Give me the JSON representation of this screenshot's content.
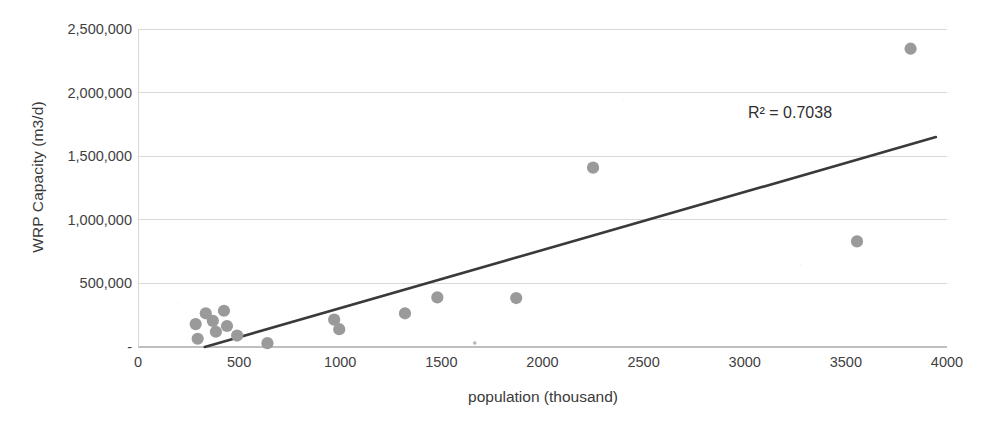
{
  "chart_data": {
    "type": "scatter",
    "title": "",
    "xlabel": "population (thousand)",
    "ylabel": "WRP Capacity (m3/d)",
    "xlim": [
      0,
      4000
    ],
    "ylim": [
      0,
      2500000
    ],
    "grid": true,
    "legend": "none",
    "x_ticks": [
      {
        "value": 0,
        "label": "0"
      },
      {
        "value": 500,
        "label": "500"
      },
      {
        "value": 1000,
        "label": "1000"
      },
      {
        "value": 1500,
        "label": "1500"
      },
      {
        "value": 2000,
        "label": "2000"
      },
      {
        "value": 2500,
        "label": "2500"
      },
      {
        "value": 3000,
        "label": "3000"
      },
      {
        "value": 3500,
        "label": "3500"
      },
      {
        "value": 4000,
        "label": "4000"
      }
    ],
    "y_ticks": [
      {
        "value": 0,
        "label": "-"
      },
      {
        "value": 500000,
        "label": "500,000"
      },
      {
        "value": 1000000,
        "label": "1,000,000"
      },
      {
        "value": 1500000,
        "label": "1,500,000"
      },
      {
        "value": 2000000,
        "label": "2,000,000"
      },
      {
        "value": 2500000,
        "label": "2,500,000"
      }
    ],
    "points": [
      {
        "x": 285,
        "y": 180000
      },
      {
        "x": 295,
        "y": 65000
      },
      {
        "x": 335,
        "y": 265000
      },
      {
        "x": 370,
        "y": 205000
      },
      {
        "x": 385,
        "y": 120000
      },
      {
        "x": 425,
        "y": 285000
      },
      {
        "x": 440,
        "y": 165000
      },
      {
        "x": 490,
        "y": 90000
      },
      {
        "x": 640,
        "y": 30000
      },
      {
        "x": 970,
        "y": 215000
      },
      {
        "x": 995,
        "y": 140000
      },
      {
        "x": 1320,
        "y": 265000
      },
      {
        "x": 1480,
        "y": 390000
      },
      {
        "x": 1665,
        "y": 32000
      },
      {
        "x": 1870,
        "y": 385000
      },
      {
        "x": 2250,
        "y": 1410000
      },
      {
        "x": 3555,
        "y": 830000
      },
      {
        "x": 3820,
        "y": 2345000
      }
    ],
    "trendline": {
      "label": "linear trendline",
      "x_start": 330,
      "y_start": 0,
      "x_end": 3945,
      "y_end": 1650000
    },
    "annotations": [
      {
        "name": "r-squared",
        "text": "R² = 0.7038"
      }
    ],
    "colors": {
      "point": "#9a9a9a",
      "trendline": "#3a3a3a",
      "gridline": "#d9d9d9",
      "axis": "#bfbfbf",
      "text": "#3a3a3a"
    }
  }
}
